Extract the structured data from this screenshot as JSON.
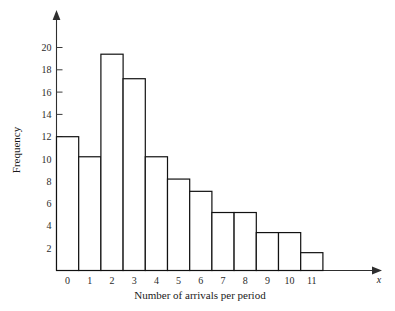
{
  "chart_data": {
    "type": "bar",
    "title": "",
    "subtitle": "",
    "xlabel": "Number of arrivals per period",
    "ylabel": "Frequency",
    "x_axis_variable": "x",
    "categories": [
      "0",
      "1",
      "2",
      "3",
      "4",
      "5",
      "6",
      "7",
      "8",
      "9",
      "10",
      "11"
    ],
    "values": [
      12,
      10.2,
      19.4,
      17.2,
      10.2,
      8.2,
      7.1,
      5.2,
      5.2,
      3.4,
      3.4,
      1.6
    ],
    "y_ticks": [
      2,
      4,
      6,
      8,
      10,
      12,
      14,
      16,
      18,
      20
    ],
    "ylim": [
      0,
      21.5
    ],
    "xlim": [
      0,
      12
    ],
    "grid": false,
    "legend": false,
    "bar_fill_color": "#ffffff",
    "bar_edge_color": "#111111",
    "axis_color": "#2e2e2e",
    "axis_arrows": true
  },
  "figure": {
    "background_color": "#ffffff"
  }
}
